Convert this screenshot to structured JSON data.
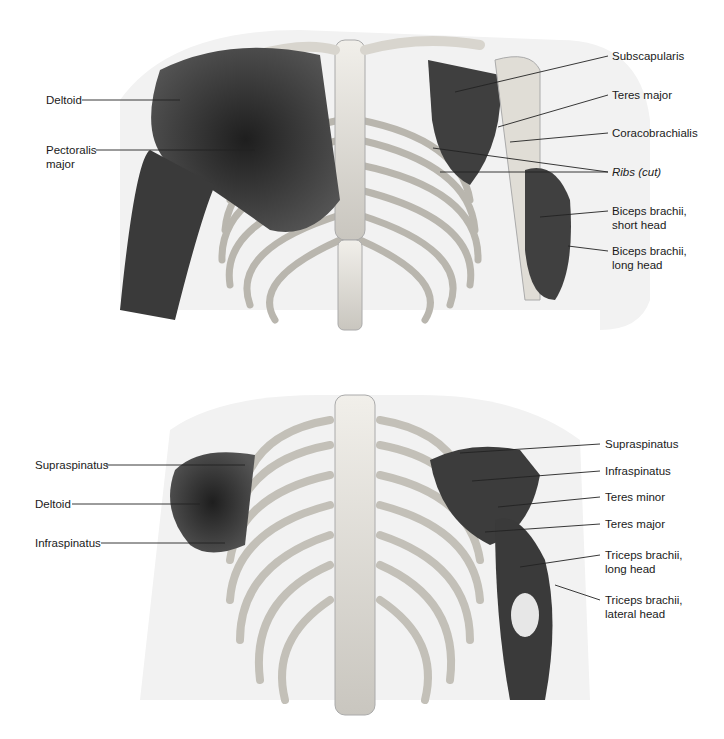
{
  "anterior_view": {
    "left_labels": [
      {
        "text": "Deltoid"
      },
      {
        "text": "Pectoralis\nmajor"
      }
    ],
    "right_labels": [
      {
        "text": "Subscapularis"
      },
      {
        "text": "Teres major"
      },
      {
        "text": "Coracobrachialis"
      },
      {
        "text": "Ribs (cut)"
      },
      {
        "text": "Biceps brachii,\nshort head"
      },
      {
        "text": "Biceps brachii,\nlong head"
      }
    ]
  },
  "posterior_view": {
    "left_labels": [
      {
        "text": "Supraspinatus"
      },
      {
        "text": "Deltoid"
      },
      {
        "text": "Infraspinatus"
      }
    ],
    "right_labels": [
      {
        "text": "Supraspinatus"
      },
      {
        "text": "Infraspinatus"
      },
      {
        "text": "Teres minor"
      },
      {
        "text": "Teres major"
      },
      {
        "text": "Triceps brachii,\nlong head"
      },
      {
        "text": "Triceps brachii,\nlateral head"
      }
    ]
  },
  "colors": {
    "muscle": "#3a3a3a",
    "bone": "#e4e2dc",
    "skin": "#efefef",
    "leader": "#222222"
  }
}
